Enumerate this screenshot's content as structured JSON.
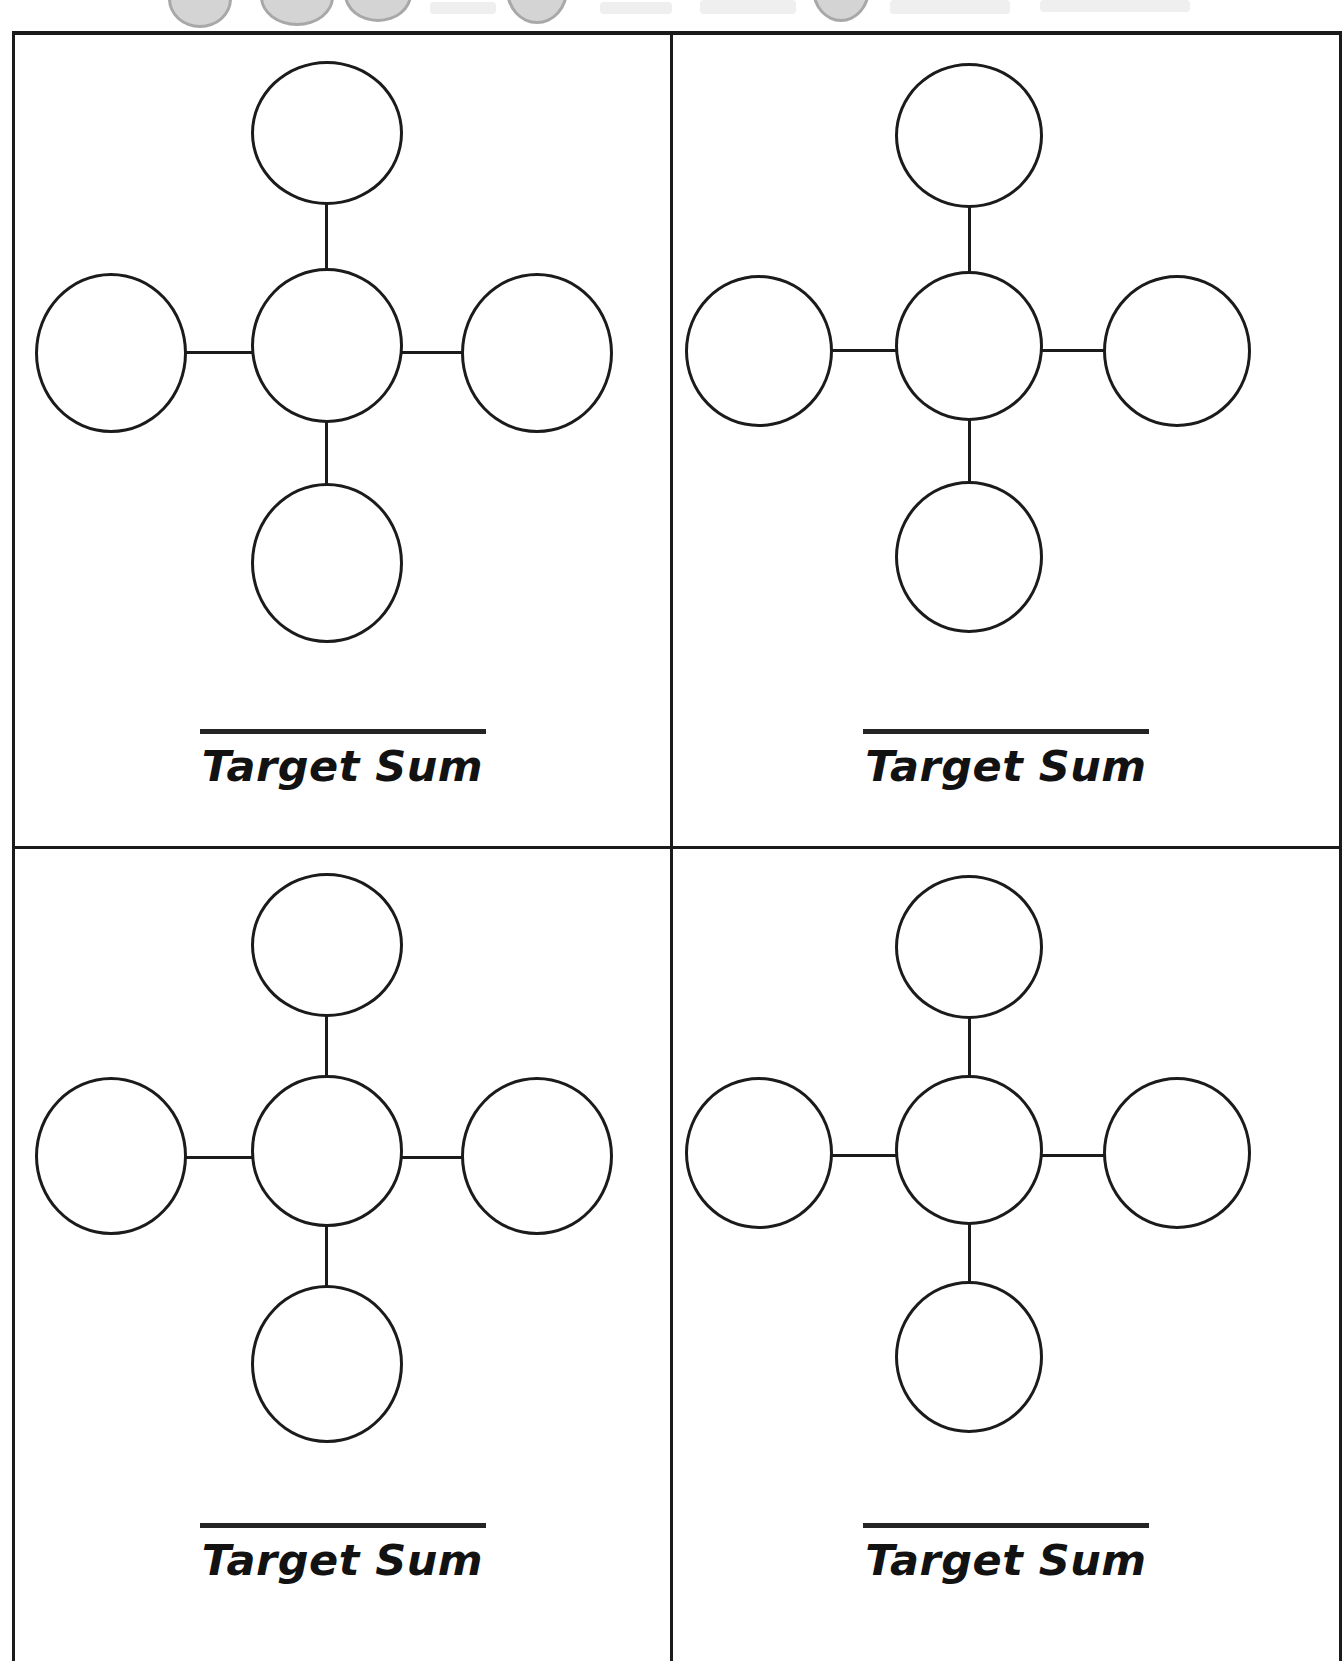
{
  "document": {
    "type": "math-worksheet",
    "title": "Target Sum cross puzzles",
    "grid": {
      "columns": 2,
      "rows": 2,
      "panel_count": 4
    }
  },
  "header_bleed": {
    "description": "cut-off gray circles from the header row above",
    "color": "#d4d4d4",
    "outline": "#a8a8a8"
  },
  "labels": {
    "target_sum": "Target Sum"
  },
  "panels": [
    {
      "id": "panel-1",
      "position": "top-left",
      "caption": "Target Sum",
      "answer_value": "",
      "nodes": {
        "center": "",
        "top": "",
        "bottom": "",
        "left": "",
        "right": ""
      }
    },
    {
      "id": "panel-2",
      "position": "top-right",
      "caption": "Target Sum",
      "answer_value": "",
      "nodes": {
        "center": "",
        "top": "",
        "bottom": "",
        "left": "",
        "right": ""
      }
    },
    {
      "id": "panel-3",
      "position": "bottom-left",
      "caption": "Target Sum",
      "answer_value": "",
      "nodes": {
        "center": "",
        "top": "",
        "bottom": "",
        "left": "",
        "right": ""
      }
    },
    {
      "id": "panel-4",
      "position": "bottom-right",
      "caption": "Target Sum",
      "answer_value": "",
      "nodes": {
        "center": "",
        "top": "",
        "bottom": "",
        "left": "",
        "right": ""
      }
    }
  ],
  "colors": {
    "ink": "#1b1b1b",
    "paper": "#ffffff",
    "rule": "#242424"
  }
}
